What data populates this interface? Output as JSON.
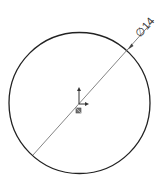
{
  "drawing": {
    "type": "sketch",
    "dimension": {
      "symbol": "∅",
      "value": "14",
      "label": "∅14"
    },
    "colors": {
      "background": "#ffffff",
      "circle": "#222222",
      "dimension_line": "#555555",
      "text": "#333333",
      "origin": "#333333"
    },
    "icons": [
      "origin-axis-icon",
      "fixed-point-icon"
    ]
  }
}
